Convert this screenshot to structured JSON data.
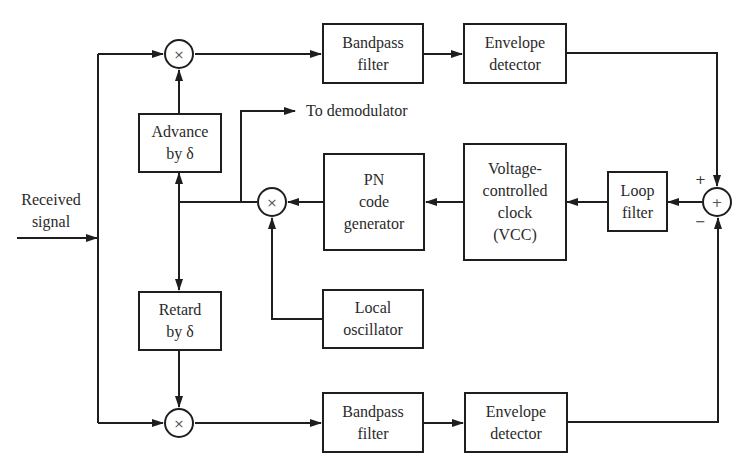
{
  "diagram": {
    "type": "block-diagram",
    "title": "",
    "colors": {
      "line": "#1e1e1e",
      "text": "#2a2a2a",
      "background": "#ffffff"
    },
    "input": {
      "label_line1": "Received",
      "label_line2": "signal"
    },
    "output_tap": {
      "label": "To demodulator"
    },
    "blocks": {
      "advance": {
        "line1": "Advance",
        "line2": "by δ"
      },
      "retard": {
        "line1": "Retard",
        "line2": "by δ"
      },
      "bandpass_top": {
        "line1": "Bandpass",
        "line2": "filter"
      },
      "envelope_top": {
        "line1": "Envelope",
        "line2": "detector"
      },
      "bandpass_bottom": {
        "line1": "Bandpass",
        "line2": "filter"
      },
      "envelope_bottom": {
        "line1": "Envelope",
        "line2": "detector"
      },
      "pn_generator": {
        "line1": "PN",
        "line2": "code",
        "line3": "generator"
      },
      "vcc": {
        "line1": "Voltage-",
        "line2": "controlled",
        "line3": "clock",
        "line4": "(VCC)"
      },
      "loop_filter": {
        "line1": "Loop",
        "line2": "filter"
      },
      "local_oscillator": {
        "line1": "Local",
        "line2": "oscillator"
      }
    },
    "nodes": {
      "mixer_top": {
        "symbol": "×"
      },
      "mixer_middle": {
        "symbol": "×"
      },
      "mixer_bottom": {
        "symbol": "×"
      },
      "summer": {
        "symbol": "+",
        "plus_sign": "+",
        "minus_sign": "−"
      }
    },
    "connections": [
      {
        "from": "Received signal",
        "to": "split"
      },
      {
        "from": "split",
        "to": "mixer_top"
      },
      {
        "from": "split",
        "to": "mixer_bottom"
      },
      {
        "from": "Advance by δ",
        "to": "mixer_top"
      },
      {
        "from": "Retard by δ",
        "to": "mixer_bottom"
      },
      {
        "from": "mixer_top",
        "to": "Bandpass filter (top)"
      },
      {
        "from": "Bandpass filter (top)",
        "to": "Envelope detector (top)"
      },
      {
        "from": "Envelope detector (top)",
        "to": "summer",
        "sign": "+"
      },
      {
        "from": "mixer_bottom",
        "to": "Bandpass filter (bottom)"
      },
      {
        "from": "Bandpass filter (bottom)",
        "to": "Envelope detector (bottom)"
      },
      {
        "from": "Envelope detector (bottom)",
        "to": "summer",
        "sign": "−"
      },
      {
        "from": "summer",
        "to": "Loop filter"
      },
      {
        "from": "Loop filter",
        "to": "Voltage-controlled clock (VCC)"
      },
      {
        "from": "Voltage-controlled clock (VCC)",
        "to": "PN code generator"
      },
      {
        "from": "PN code generator",
        "to": "mixer_middle"
      },
      {
        "from": "Local oscillator",
        "to": "mixer_middle"
      },
      {
        "from": "mixer_middle",
        "to": "Advance by δ"
      },
      {
        "from": "mixer_middle",
        "to": "Retard by δ"
      },
      {
        "from": "mixer_middle",
        "to": "To demodulator"
      }
    ]
  }
}
